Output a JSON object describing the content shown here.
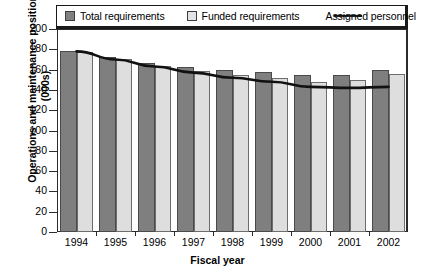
{
  "chart_data": {
    "type": "bar",
    "title": "",
    "xlabel": "Fiscal year",
    "ylabel": "Operations and maintenance positions (000s)",
    "categories": [
      "1994",
      "1995",
      "1996",
      "1997",
      "1998",
      "1999",
      "2000",
      "2001",
      "2002"
    ],
    "ylim": [
      0,
      200
    ],
    "yticks": [
      0,
      20,
      40,
      60,
      80,
      100,
      120,
      140,
      160,
      180,
      200
    ],
    "grid": false,
    "legend_position": "top",
    "series": [
      {
        "name": "Total requirements",
        "kind": "bar",
        "color": "#7f7f7f",
        "values": [
          178,
          172,
          167,
          163,
          160,
          158,
          155,
          155,
          160
        ]
      },
      {
        "name": "Funded requirements",
        "kind": "bar",
        "color": "#dedede",
        "values": [
          177,
          170,
          164,
          159,
          155,
          152,
          148,
          150,
          156
        ]
      },
      {
        "name": "Assigned personnel",
        "kind": "line",
        "color": "#111111",
        "values": [
          178,
          170,
          163,
          157,
          152,
          148,
          143,
          142,
          143
        ]
      }
    ]
  },
  "legend": {
    "items": [
      {
        "label": "Total requirements",
        "marker": "filled-square-dark"
      },
      {
        "label": "Funded requirements",
        "marker": "filled-square-light"
      },
      {
        "label": "Assigned personnel",
        "marker": "line"
      }
    ]
  },
  "axes": {
    "y_title": "Operations and maintenance positions (000s)",
    "x_title": "Fiscal year"
  }
}
